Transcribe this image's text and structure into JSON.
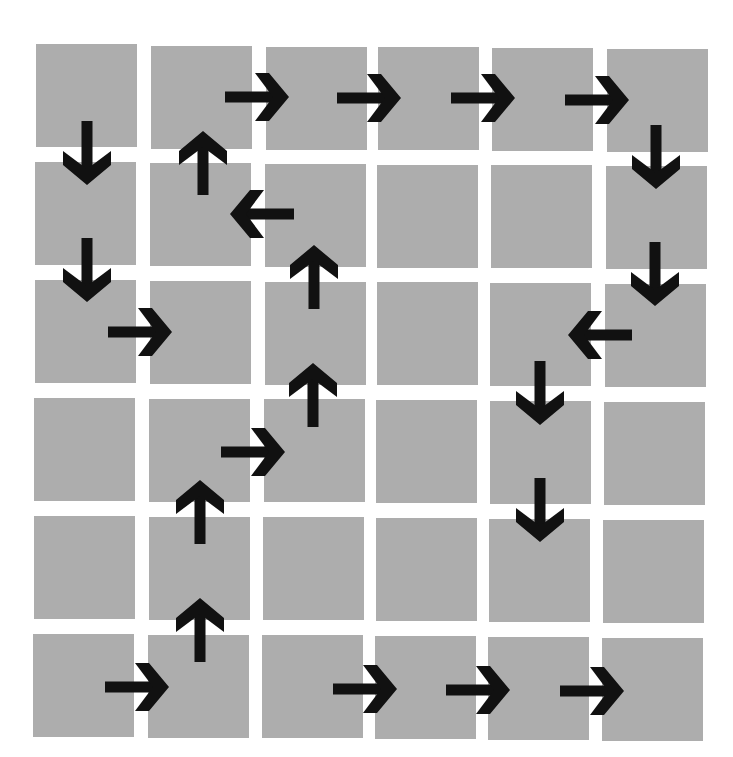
{
  "grid": {
    "rows": 6,
    "cols": 6,
    "cell_color": "#adadad",
    "background_color": "#ffffff",
    "arrow_color": "#111111",
    "cells": [
      {
        "row": 0,
        "col": 0,
        "x": 36,
        "y": 44
      },
      {
        "row": 0,
        "col": 1,
        "x": 151,
        "y": 46
      },
      {
        "row": 0,
        "col": 2,
        "x": 266,
        "y": 47
      },
      {
        "row": 0,
        "col": 3,
        "x": 378,
        "y": 47
      },
      {
        "row": 0,
        "col": 4,
        "x": 492,
        "y": 48
      },
      {
        "row": 0,
        "col": 5,
        "x": 607,
        "y": 49
      },
      {
        "row": 1,
        "col": 0,
        "x": 35,
        "y": 162
      },
      {
        "row": 1,
        "col": 1,
        "x": 150,
        "y": 163
      },
      {
        "row": 1,
        "col": 2,
        "x": 265,
        "y": 164
      },
      {
        "row": 1,
        "col": 3,
        "x": 377,
        "y": 165
      },
      {
        "row": 1,
        "col": 4,
        "x": 491,
        "y": 165
      },
      {
        "row": 1,
        "col": 5,
        "x": 606,
        "y": 166
      },
      {
        "row": 2,
        "col": 0,
        "x": 35,
        "y": 280
      },
      {
        "row": 2,
        "col": 1,
        "x": 150,
        "y": 281
      },
      {
        "row": 2,
        "col": 2,
        "x": 265,
        "y": 282
      },
      {
        "row": 2,
        "col": 3,
        "x": 377,
        "y": 282
      },
      {
        "row": 2,
        "col": 4,
        "x": 490,
        "y": 283
      },
      {
        "row": 2,
        "col": 5,
        "x": 605,
        "y": 284
      },
      {
        "row": 3,
        "col": 0,
        "x": 34,
        "y": 398
      },
      {
        "row": 3,
        "col": 1,
        "x": 149,
        "y": 399
      },
      {
        "row": 3,
        "col": 2,
        "x": 264,
        "y": 399
      },
      {
        "row": 3,
        "col": 3,
        "x": 376,
        "y": 400
      },
      {
        "row": 3,
        "col": 4,
        "x": 490,
        "y": 401
      },
      {
        "row": 3,
        "col": 5,
        "x": 604,
        "y": 402
      },
      {
        "row": 4,
        "col": 0,
        "x": 34,
        "y": 516
      },
      {
        "row": 4,
        "col": 1,
        "x": 149,
        "y": 517
      },
      {
        "row": 4,
        "col": 2,
        "x": 263,
        "y": 517
      },
      {
        "row": 4,
        "col": 3,
        "x": 376,
        "y": 518
      },
      {
        "row": 4,
        "col": 4,
        "x": 489,
        "y": 519
      },
      {
        "row": 4,
        "col": 5,
        "x": 603,
        "y": 520
      },
      {
        "row": 5,
        "col": 0,
        "x": 33,
        "y": 634
      },
      {
        "row": 5,
        "col": 1,
        "x": 148,
        "y": 635
      },
      {
        "row": 5,
        "col": 2,
        "x": 262,
        "y": 635
      },
      {
        "row": 5,
        "col": 3,
        "x": 375,
        "y": 636
      },
      {
        "row": 5,
        "col": 4,
        "x": 488,
        "y": 637
      },
      {
        "row": 5,
        "col": 5,
        "x": 602,
        "y": 638
      }
    ]
  },
  "arrows": [
    {
      "id": "a1",
      "dir": "right",
      "x": 257,
      "y": 97
    },
    {
      "id": "a2",
      "dir": "right",
      "x": 369,
      "y": 98
    },
    {
      "id": "a3",
      "dir": "right",
      "x": 483,
      "y": 98
    },
    {
      "id": "a4",
      "dir": "right",
      "x": 597,
      "y": 100
    },
    {
      "id": "a5",
      "dir": "down",
      "x": 87,
      "y": 153
    },
    {
      "id": "a6",
      "dir": "down",
      "x": 87,
      "y": 270
    },
    {
      "id": "a7",
      "dir": "right",
      "x": 140,
      "y": 332
    },
    {
      "id": "a8",
      "dir": "up",
      "x": 203,
      "y": 163
    },
    {
      "id": "a9",
      "dir": "left",
      "x": 262,
      "y": 214
    },
    {
      "id": "a10",
      "dir": "up",
      "x": 314,
      "y": 277
    },
    {
      "id": "a11",
      "dir": "up",
      "x": 313,
      "y": 395
    },
    {
      "id": "a12",
      "dir": "right",
      "x": 253,
      "y": 452
    },
    {
      "id": "a13",
      "dir": "up",
      "x": 200,
      "y": 512
    },
    {
      "id": "a14",
      "dir": "up",
      "x": 200,
      "y": 630
    },
    {
      "id": "a15",
      "dir": "right",
      "x": 137,
      "y": 687
    },
    {
      "id": "a16",
      "dir": "down",
      "x": 656,
      "y": 157
    },
    {
      "id": "a17",
      "dir": "down",
      "x": 655,
      "y": 274
    },
    {
      "id": "a18",
      "dir": "left",
      "x": 600,
      "y": 335
    },
    {
      "id": "a19",
      "dir": "down",
      "x": 540,
      "y": 393
    },
    {
      "id": "a20",
      "dir": "down",
      "x": 540,
      "y": 510
    },
    {
      "id": "a21",
      "dir": "right",
      "x": 365,
      "y": 689
    },
    {
      "id": "a22",
      "dir": "right",
      "x": 478,
      "y": 690
    },
    {
      "id": "a23",
      "dir": "right",
      "x": 592,
      "y": 691
    }
  ]
}
